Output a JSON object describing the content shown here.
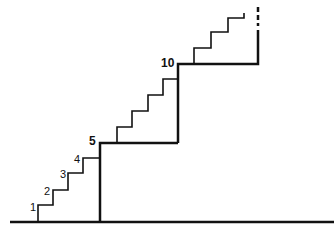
{
  "diagram": {
    "type": "staircase",
    "labels": {
      "step1": "1",
      "step2": "2",
      "step3": "3",
      "step4": "4",
      "step5": "5",
      "step10": "10"
    },
    "line_color": "#111111",
    "background": "#ffffff"
  }
}
